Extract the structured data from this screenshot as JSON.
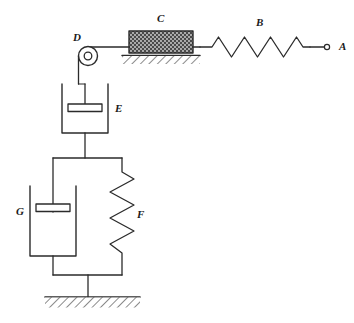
{
  "figure": {
    "type": "mechanical-system-schematic",
    "background_color": "#ffffff",
    "line_color": "#2b2b2b",
    "block_fill_color": "#3d3d3d"
  },
  "labels": {
    "a": "A",
    "b": "B",
    "c": "C",
    "d": "D",
    "e": "E",
    "f": "F",
    "g": "G"
  },
  "components": {
    "point_a": {
      "label": "A",
      "name": "free-end-node",
      "x": 327,
      "y": 47
    },
    "spring_b": {
      "label": "B",
      "name": "horizontal-spring",
      "orientation": "horizontal",
      "coils": 7,
      "x_start": 210,
      "x_end": 310,
      "y": 47
    },
    "block_c": {
      "label": "C",
      "name": "sliding-block",
      "x": 129,
      "y": 31,
      "width": 64,
      "height": 22,
      "hatching": "cross-hatch"
    },
    "ground_top": {
      "name": "upper-ground-support",
      "x_start": 122,
      "x_end": 200,
      "y": 55
    },
    "pulley_d": {
      "label": "D",
      "name": "pulley",
      "cx": 88,
      "cy": 56,
      "outer_radius": 10,
      "inner_radius": 4
    },
    "dashpot_e": {
      "label": "E",
      "name": "upper-dashpot",
      "orientation": "vertical",
      "x": 62,
      "y": 84,
      "width": 46,
      "height": 49
    },
    "dashpot_g": {
      "label": "G",
      "name": "lower-dashpot",
      "orientation": "vertical",
      "x": 30,
      "y": 186,
      "width": 46,
      "height": 70
    },
    "spring_f": {
      "label": "F",
      "name": "vertical-spring",
      "orientation": "vertical",
      "coils": 6,
      "x": 122,
      "y_start": 172,
      "y_end": 262
    },
    "ground_bottom": {
      "name": "lower-ground-support",
      "x_start": 45,
      "x_end": 140,
      "y": 297
    }
  },
  "connections": [
    {
      "name": "a-to-spring-b",
      "from": "A",
      "to": "B"
    },
    {
      "name": "spring-b-to-block-c",
      "from": "B",
      "to": "C"
    },
    {
      "name": "block-c-to-pulley-d",
      "from": "C",
      "to": "D"
    },
    {
      "name": "pulley-d-to-dashpot-e",
      "from": "D",
      "to": "E"
    },
    {
      "name": "dashpot-e-to-crossbar",
      "from": "E",
      "to": "crossbar"
    },
    {
      "name": "crossbar-to-dashpot-g",
      "from": "crossbar",
      "to": "G"
    },
    {
      "name": "crossbar-to-spring-f",
      "from": "crossbar",
      "to": "F"
    },
    {
      "name": "g-and-f-to-ground",
      "from": "G,F",
      "to": "ground"
    }
  ]
}
